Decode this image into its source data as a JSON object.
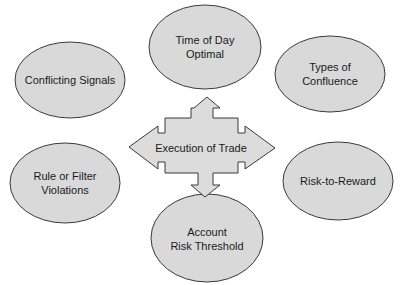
{
  "diagram": {
    "center": {
      "label": "Execution of Trade",
      "shape": "four-way-arrow"
    },
    "nodes": [
      {
        "id": "time-of-day",
        "lines": [
          "Time of Day",
          "Optimal"
        ]
      },
      {
        "id": "conflicting-signals",
        "lines": [
          "Conflicting Signals"
        ]
      },
      {
        "id": "types-of-confluence",
        "lines": [
          "Types of",
          "Confluence"
        ]
      },
      {
        "id": "rule-filter-violations",
        "lines": [
          "Rule or Filter",
          "Violations"
        ]
      },
      {
        "id": "risk-to-reward",
        "lines": [
          "Risk-to-Reward"
        ]
      },
      {
        "id": "account-risk-threshold",
        "lines": [
          "Account",
          "Risk Threshold"
        ]
      }
    ],
    "colors": {
      "ellipse_fill": "#d9d9d9",
      "arrow_fill": "#dcdcdc",
      "stroke": "#3a3a3a",
      "background": "#ffffff"
    }
  }
}
